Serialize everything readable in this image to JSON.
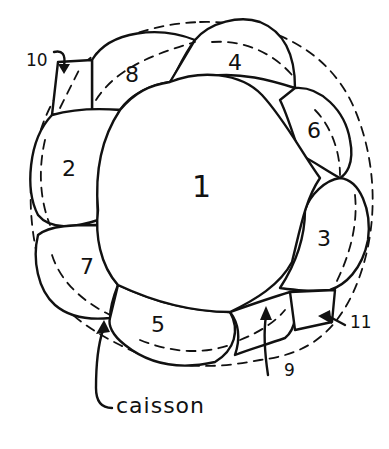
{
  "diagram": {
    "type": "plan-view sketch",
    "central_cell": {
      "label": "1"
    },
    "perimeter_cells": [
      {
        "label": "2",
        "position": "left"
      },
      {
        "label": "3",
        "position": "right"
      },
      {
        "label": "4",
        "position": "top"
      },
      {
        "label": "5",
        "position": "bottom"
      },
      {
        "label": "6",
        "position": "upper-right"
      },
      {
        "label": "7",
        "position": "lower-left"
      },
      {
        "label": "8",
        "position": "upper-left"
      }
    ],
    "callouts": [
      {
        "label": "10",
        "position": "upper-left",
        "points_to": "gap between cells 2 and 8"
      },
      {
        "label": "9",
        "position": "bottom",
        "points_to": "gap between cells 5 and 3"
      },
      {
        "label": "11",
        "position": "lower-right",
        "points_to": "gap near cell 3"
      }
    ],
    "caption": {
      "text": "caisson",
      "points_to": "joint between cells 7 and 5"
    },
    "colors": {
      "ink": "#111111",
      "background": "#ffffff"
    }
  }
}
